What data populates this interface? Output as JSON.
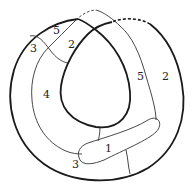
{
  "diagram": {
    "type": "topological-region-diagram",
    "colors": {
      "stroke": "#1a1a1a",
      "thin_stroke": "#333333",
      "background": "#ffffff"
    },
    "labels": [
      {
        "id": "region-5-top-left",
        "text": "5",
        "x": 53,
        "y": 34
      },
      {
        "id": "region-3-top-left",
        "text": "3",
        "x": 30,
        "y": 52
      },
      {
        "id": "region-2-top",
        "text": "2",
        "x": 68,
        "y": 48
      },
      {
        "id": "region-4-left",
        "text": "4",
        "x": 43,
        "y": 98
      },
      {
        "id": "region-5-right",
        "text": "5",
        "x": 137,
        "y": 80
      },
      {
        "id": "region-2-right",
        "text": "2",
        "x": 162,
        "y": 80
      },
      {
        "id": "region-1-capsule",
        "text": "1",
        "x": 105,
        "y": 152
      },
      {
        "id": "region-3-bottom",
        "text": "3",
        "x": 72,
        "y": 168
      }
    ]
  }
}
